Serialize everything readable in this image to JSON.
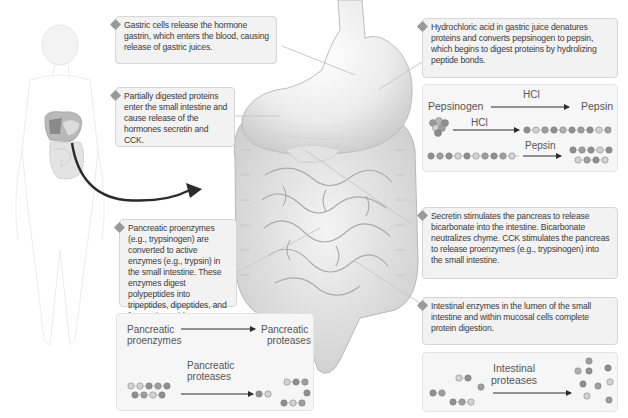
{
  "steps": [
    {
      "number": "1",
      "text": "Gastric cells release the hormone gastrin, which enters the blood, causing release of gastric juices."
    },
    {
      "number": "2",
      "text": "Hydrochloric acid in gastric juice denatures proteins and converts pepsinogen to pepsin, which begins to digest proteins by hydrolizing peptide bonds."
    },
    {
      "number": "3",
      "text": "Partially digested proteins enter the small intestine and cause release of the hormones secretin and CCK."
    },
    {
      "number": "4",
      "text": "Secretin stimulates the pancreas to release bicarbonate into the intestine. Bicarbonate neutralizes chyme. CCK stimulates the pancreas to release proenzymes (e.g., trypsinogen) into the small intestine."
    },
    {
      "number": "5",
      "text": "Pancreatic proenzymes (e.g., trypsinogen) are converted to active enzymes (e.g., trypsin) in the small intestine. These enzymes digest polypeptides into tripeptides, dipeptides, and free amino acids"
    },
    {
      "number": "6",
      "text": "Intestinal enzymes in the lumen of the small intestine and within mucosal cells complete protein digestion."
    }
  ],
  "pepsin_diagram": {
    "row1_from": "Pepsinogen",
    "row1_arrow": "HCl",
    "row1_to": "Pepsin",
    "row2_arrow": "HCl",
    "row3_arrow": "Pepsin"
  },
  "pancreatic_diagram": {
    "from_line1": "Pancreatic",
    "from_line2": "proenzymes",
    "to_line1": "Pancreatic",
    "to_line2": "proteases",
    "arrow_line1": "Pancreatic",
    "arrow_line2": "proteases"
  },
  "intestinal_diagram": {
    "arrow_line1": "Intestinal",
    "arrow_line2": "proteases"
  },
  "colors": {
    "box_bg": "#f2f2f2",
    "box_border": "#d6d6d6",
    "badge": "#9a9a9a",
    "arrow": "#2b2b2b",
    "bead_dark": "#8f8f8f",
    "bead_mid": "#b0b0b0",
    "bead_light": "#d6d6d6"
  }
}
